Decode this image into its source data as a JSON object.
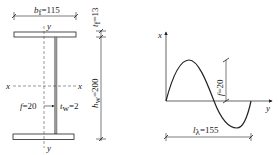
{
  "section": {
    "flange_width_label": "b",
    "flange_width_sub": "f",
    "flange_width_value": "=115",
    "flange_thickness_label": "t",
    "flange_thickness_sub": "f",
    "flange_thickness_value": "=13",
    "web_height_label": "h",
    "web_height_sub": "w",
    "web_height_value": "=200",
    "web_thickness_label": "t",
    "web_thickness_sub": "w",
    "web_thickness_value": "=2",
    "imperfection_label": "f",
    "imperfection_value": "=20",
    "axis_y_top": "y",
    "axis_y_bottom": "y",
    "axis_x_left": "x",
    "axis_x_right": "x"
  },
  "wave": {
    "axis_vertical": "x",
    "axis_horizontal": "y",
    "amplitude_label": "f",
    "amplitude_value": "=20",
    "wavelength_label": "l",
    "wavelength_sub": "λ",
    "wavelength_value": "=155"
  },
  "colors": {
    "line": "#222222",
    "web_fill": "#9a9a9a"
  }
}
